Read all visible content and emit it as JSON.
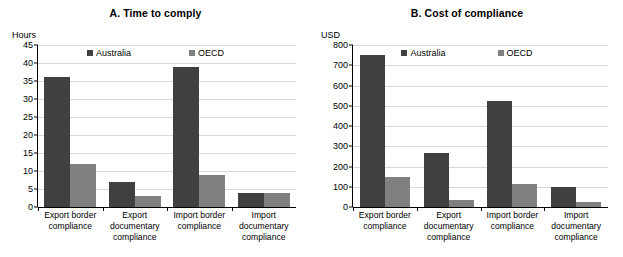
{
  "chart_data": [
    {
      "type": "bar",
      "panel_id": "A",
      "title": "A. Time to comply",
      "ylabel": "Hours",
      "xlabel": "",
      "ylim": [
        0,
        45
      ],
      "yticks": [
        45,
        40,
        35,
        30,
        25,
        20,
        15,
        10,
        5,
        0
      ],
      "grid": true,
      "legend_position": "top-center",
      "categories": [
        "Export border compliance",
        "Export documentary compliance",
        "Import border compliance",
        "Import documentary compliance"
      ],
      "categories_lines": [
        [
          "Export border",
          "compliance"
        ],
        [
          "Export",
          "documentary",
          "compliance"
        ],
        [
          "Import border",
          "compliance"
        ],
        [
          "Import",
          "documentary",
          "compliance"
        ]
      ],
      "series": [
        {
          "name": "Australia",
          "color": "#404040",
          "values": [
            36,
            7,
            39,
            4
          ]
        },
        {
          "name": "OECD",
          "color": "#808080",
          "values": [
            12,
            3,
            9,
            4
          ]
        }
      ]
    },
    {
      "type": "bar",
      "panel_id": "B",
      "title": "B. Cost of compliance",
      "ylabel": "USD",
      "xlabel": "",
      "ylim": [
        0,
        800
      ],
      "yticks": [
        800,
        700,
        600,
        500,
        400,
        300,
        200,
        100,
        0
      ],
      "grid": true,
      "legend_position": "top-center",
      "categories": [
        "Export border compliance",
        "Export documentary compliance",
        "Import border compliance",
        "Import documentary compliance"
      ],
      "categories_lines": [
        [
          "Export border",
          "compliance"
        ],
        [
          "Export",
          "documentary",
          "compliance"
        ],
        [
          "Import border",
          "compliance"
        ],
        [
          "Import",
          "documentary",
          "compliance"
        ]
      ],
      "series": [
        {
          "name": "Australia",
          "color": "#404040",
          "values": [
            750,
            265,
            525,
            100
          ]
        },
        {
          "name": "OECD",
          "color": "#808080",
          "values": [
            150,
            35,
            115,
            25
          ]
        }
      ]
    }
  ]
}
